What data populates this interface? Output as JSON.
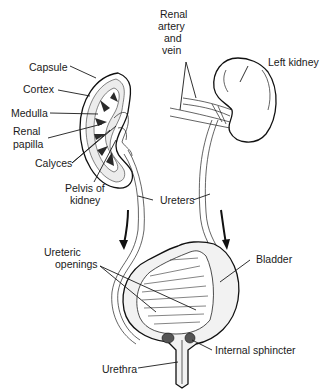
{
  "labels": {
    "capsule": "Capsule",
    "cortex": "Cortex",
    "medulla": "Medulla",
    "renal_papilla_1": "Renal",
    "renal_papilla_2": "papilla",
    "calyces": "Calyces",
    "pelvis_1": "Pelvis of",
    "pelvis_2": "kidney",
    "renal_av_1": "Renal",
    "renal_av_2": "artery",
    "renal_av_3": "and",
    "renal_av_4": "vein",
    "left_kidney": "Left kidney",
    "ureters": "Ureters",
    "ureteric_1": "Ureteric",
    "ureteric_2": "openings",
    "bladder": "Bladder",
    "internal_sphincter": "Internal sphincter",
    "urethra": "Urethra"
  },
  "colors": {
    "ink": "#1a1a1a",
    "background": "#ffffff",
    "shade": "#e6e6e6"
  }
}
